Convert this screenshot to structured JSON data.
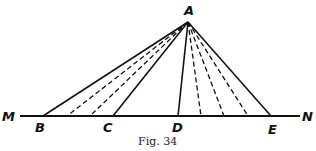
{
  "figure": {
    "caption": "Fig. 34",
    "apex": {
      "label": "A",
      "x": 188,
      "y": 22
    },
    "baseline": {
      "start_label": "M",
      "end_label": "N",
      "y": 116,
      "x1": 20,
      "x2": 300
    },
    "points": [
      {
        "label": "B",
        "x": 43
      },
      {
        "label": "C",
        "x": 113
      },
      {
        "label": "D",
        "x": 178
      },
      {
        "label": "E",
        "x": 271
      }
    ],
    "dashed_feet": [
      67,
      90,
      201,
      224,
      248
    ],
    "colors": {
      "line": "#111111",
      "background": "#ffffff"
    }
  }
}
